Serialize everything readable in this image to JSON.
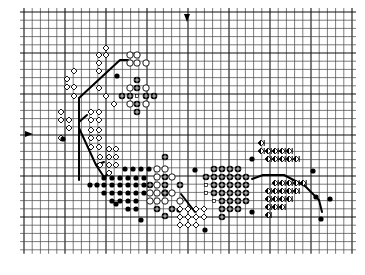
{
  "pattern": {
    "title": "",
    "grid": {
      "x0": 24,
      "y0": 12,
      "cell": 8.2,
      "cols": 40,
      "rows": 29,
      "major_every": 10,
      "line_color": "#444444",
      "major_color": "#111111",
      "background": "#ffffff"
    },
    "center_markers": {
      "top": {
        "x": 187,
        "y": 18,
        "icon": "down-arrow-marker"
      },
      "left": {
        "x": 31,
        "y": 134,
        "icon": "right-arrow-marker"
      }
    },
    "legend_symbols": {
      "open-diamond": "◇",
      "filled-dot": "●",
      "open-circle": "○",
      "crossed-circle": "⊕",
      "small-square": "▫",
      "half-diamond": "◈"
    },
    "backstitch_lines": [
      {
        "points": [
          [
            79,
            98
          ],
          [
            120,
            60
          ],
          [
            128,
            60
          ]
        ]
      },
      {
        "points": [
          [
            79,
            98
          ],
          [
            79,
            180
          ]
        ]
      },
      {
        "points": [
          [
            79,
            122
          ],
          [
            87,
            115
          ]
        ]
      },
      {
        "points": [
          [
            79,
            128
          ],
          [
            96,
            165
          ],
          [
            104,
            177
          ]
        ]
      },
      {
        "points": [
          [
            96,
            165
          ],
          [
            104,
            162
          ]
        ]
      },
      {
        "points": [
          [
            104,
            177
          ],
          [
            111,
            172
          ]
        ]
      },
      {
        "points": [
          [
            181,
            194
          ],
          [
            195,
            212
          ]
        ]
      },
      {
        "points": [
          [
            252,
            179
          ],
          [
            263,
            175
          ],
          [
            284,
            175
          ],
          [
            305,
            186
          ],
          [
            319,
            200
          ],
          [
            322,
            212
          ]
        ]
      }
    ],
    "stitches": [
      {
        "s": "open-diamond",
        "c": [
          [
            106,
            48
          ],
          [
            99,
            55
          ],
          [
            106,
            55
          ],
          [
            99,
            63
          ],
          [
            99,
            71
          ],
          [
            74,
            71
          ],
          [
            67,
            79
          ],
          [
            67,
            87
          ],
          [
            74,
            87
          ],
          [
            99,
            88
          ],
          [
            106,
            96
          ],
          [
            74,
            96
          ],
          [
            61,
            112
          ],
          [
            61,
            120
          ],
          [
            69,
            120
          ],
          [
            69,
            128
          ],
          [
            91,
            112
          ],
          [
            99,
            112
          ],
          [
            91,
            120
          ],
          [
            99,
            120
          ],
          [
            91,
            130
          ],
          [
            99,
            130
          ],
          [
            91,
            138
          ],
          [
            99,
            138
          ],
          [
            91,
            147
          ],
          [
            99,
            147
          ],
          [
            61,
            138
          ],
          [
            114,
            104
          ]
        ]
      },
      {
        "s": "open-circle",
        "c": [
          [
            130,
            55
          ],
          [
            137,
            55
          ],
          [
            130,
            63
          ],
          [
            137,
            63
          ],
          [
            146,
            63
          ],
          [
            130,
            88
          ],
          [
            146,
            88
          ],
          [
            130,
            104
          ],
          [
            146,
            104
          ]
        ]
      },
      {
        "s": "crossed-circle",
        "c": [
          [
            137,
            80
          ],
          [
            137,
            88
          ],
          [
            122,
            96
          ],
          [
            130,
            96
          ],
          [
            146,
            96
          ],
          [
            154,
            96
          ],
          [
            137,
            104
          ],
          [
            137,
            112
          ]
        ]
      },
      {
        "s": "small-square",
        "c": [
          [
            137,
            96
          ]
        ]
      },
      {
        "s": "filled-dot",
        "c": [
          [
            117,
            76
          ],
          [
            63,
            139
          ]
        ]
      },
      {
        "s": "open-diamond",
        "c": [
          [
            109,
            157
          ],
          [
            116,
            157
          ],
          [
            109,
            165
          ],
          [
            116,
            165
          ],
          [
            100,
            165
          ],
          [
            109,
            173
          ],
          [
            100,
            157
          ],
          [
            109,
            149
          ],
          [
            116,
            149
          ]
        ]
      },
      {
        "s": "filled-dot",
        "c": [
          [
            125,
            169
          ],
          [
            133,
            169
          ],
          [
            141,
            169
          ],
          [
            149,
            169
          ],
          [
            104,
            178
          ],
          [
            112,
            178
          ],
          [
            120,
            178
          ],
          [
            128,
            178
          ],
          [
            136,
            178
          ],
          [
            144,
            178
          ],
          [
            90,
            185
          ],
          [
            97,
            185
          ],
          [
            104,
            185
          ],
          [
            112,
            185
          ],
          [
            120,
            185
          ],
          [
            128,
            185
          ],
          [
            136,
            185
          ],
          [
            144,
            185
          ],
          [
            104,
            193
          ],
          [
            112,
            193
          ],
          [
            120,
            193
          ],
          [
            128,
            193
          ],
          [
            136,
            193
          ],
          [
            144,
            193
          ],
          [
            112,
            201
          ],
          [
            120,
            201
          ],
          [
            128,
            201
          ],
          [
            136,
            201
          ],
          [
            128,
            209
          ],
          [
            136,
            209
          ],
          [
            116,
            204
          ],
          [
            141,
            220
          ],
          [
            179,
            210
          ]
        ]
      },
      {
        "s": "open-circle",
        "c": [
          [
            157,
            169
          ],
          [
            157,
            177
          ],
          [
            157,
            185
          ],
          [
            157,
            193
          ],
          [
            150,
            193
          ],
          [
            150,
            201
          ],
          [
            165,
            169
          ],
          [
            165,
            193
          ],
          [
            172,
            177
          ],
          [
            172,
            193
          ],
          [
            180,
            201
          ],
          [
            165,
            201
          ],
          [
            157,
            201
          ]
        ]
      },
      {
        "s": "crossed-circle",
        "c": [
          [
            165,
            157
          ],
          [
            165,
            177
          ],
          [
            150,
            185
          ],
          [
            165,
            185
          ],
          [
            180,
            185
          ],
          [
            165,
            193
          ],
          [
            157,
            209
          ],
          [
            172,
            209
          ],
          [
            165,
            216
          ]
        ]
      },
      {
        "s": "open-diamond",
        "c": [
          [
            180,
            209
          ],
          [
            188,
            209
          ],
          [
            196,
            209
          ],
          [
            204,
            209
          ],
          [
            180,
            217
          ],
          [
            188,
            217
          ],
          [
            196,
            217
          ],
          [
            180,
            225
          ],
          [
            188,
            225
          ],
          [
            196,
            225
          ],
          [
            204,
            217
          ]
        ]
      },
      {
        "s": "filled-dot",
        "c": [
          [
            195,
            170
          ],
          [
            205,
            230
          ],
          [
            252,
            159
          ],
          [
            252,
            212
          ],
          [
            316,
            197
          ],
          [
            330,
            199
          ],
          [
            321,
            219
          ],
          [
            313,
            171
          ]
        ]
      },
      {
        "s": "crossed-circle",
        "c": [
          [
            214,
            169
          ],
          [
            222,
            169
          ],
          [
            230,
            169
          ],
          [
            238,
            169
          ],
          [
            206,
            177
          ],
          [
            214,
            177
          ],
          [
            222,
            177
          ],
          [
            230,
            177
          ],
          [
            238,
            177
          ],
          [
            246,
            177
          ],
          [
            214,
            185
          ],
          [
            222,
            185
          ],
          [
            230,
            185
          ],
          [
            238,
            185
          ],
          [
            246,
            185
          ],
          [
            214,
            193
          ],
          [
            222,
            193
          ],
          [
            230,
            193
          ],
          [
            238,
            193
          ],
          [
            246,
            193
          ],
          [
            222,
            201
          ],
          [
            230,
            201
          ],
          [
            238,
            201
          ],
          [
            246,
            201
          ],
          [
            222,
            209
          ],
          [
            230,
            209
          ],
          [
            238,
            209
          ],
          [
            222,
            217
          ]
        ]
      },
      {
        "s": "small-square",
        "c": [
          [
            206,
            185
          ],
          [
            206,
            193
          ],
          [
            214,
            201
          ]
        ]
      },
      {
        "s": "half-diamond",
        "c": [
          [
            261,
            143
          ],
          [
            261,
            151
          ],
          [
            268,
            151
          ],
          [
            275,
            151
          ],
          [
            282,
            151
          ],
          [
            289,
            151
          ],
          [
            268,
            159
          ],
          [
            275,
            159
          ],
          [
            282,
            159
          ],
          [
            289,
            159
          ],
          [
            296,
            159
          ],
          [
            275,
            183
          ],
          [
            282,
            183
          ],
          [
            289,
            183
          ],
          [
            296,
            183
          ],
          [
            303,
            183
          ],
          [
            268,
            191
          ],
          [
            275,
            191
          ],
          [
            282,
            191
          ],
          [
            289,
            191
          ],
          [
            296,
            191
          ],
          [
            268,
            199
          ],
          [
            275,
            199
          ],
          [
            282,
            199
          ],
          [
            289,
            199
          ],
          [
            268,
            207
          ],
          [
            275,
            207
          ],
          [
            282,
            207
          ],
          [
            268,
            215
          ]
        ]
      }
    ]
  }
}
